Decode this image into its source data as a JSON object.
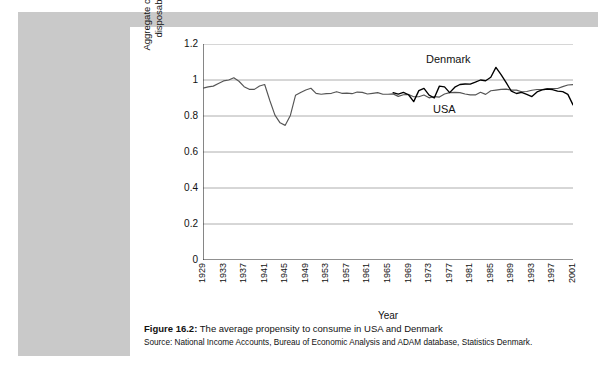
{
  "figure": {
    "label": "Figure 16.2:",
    "title": "The average propensity to consume in USA and Denmark",
    "source": "Source: National Income Accounts, Bureau of Economic Analysis and ADAM database, Statistics Denmark."
  },
  "chart_data": {
    "type": "line",
    "title": "",
    "xlabel": "Year",
    "ylabel": "Aggregate consumption / aggregate disposable household income",
    "ylim": [
      0,
      1.2
    ],
    "yticks": [
      "0",
      "0.2",
      "0.4",
      "0.6",
      "0.8",
      "1",
      "1.2"
    ],
    "ytick_values": [
      0,
      0.2,
      0.4,
      0.6,
      0.8,
      1,
      1.2
    ],
    "xlim": [
      1929,
      2001
    ],
    "xtick_labels": [
      "1929",
      "1933",
      "1937",
      "1941",
      "1945",
      "1949",
      "1953",
      "1957",
      "1961",
      "1965",
      "1969",
      "1973",
      "1977",
      "1981",
      "1985",
      "1989",
      "1993",
      "1997",
      "2001"
    ],
    "grid": "horizontal",
    "legend": "inline-annotation",
    "series": [
      {
        "name": "USA",
        "color": "#555555",
        "label_position": "inside-lower-right",
        "x": [
          1929,
          1930,
          1931,
          1932,
          1933,
          1934,
          1935,
          1936,
          1937,
          1938,
          1939,
          1940,
          1941,
          1942,
          1943,
          1944,
          1945,
          1946,
          1947,
          1948,
          1949,
          1950,
          1951,
          1952,
          1953,
          1954,
          1955,
          1956,
          1957,
          1958,
          1959,
          1960,
          1961,
          1962,
          1963,
          1964,
          1965,
          1966,
          1967,
          1968,
          1969,
          1970,
          1971,
          1972,
          1973,
          1974,
          1975,
          1976,
          1977,
          1978,
          1979,
          1980,
          1981,
          1982,
          1983,
          1984,
          1985,
          1986,
          1987,
          1988,
          1989,
          1990,
          1991,
          1992,
          1993,
          1994,
          1995,
          1996,
          1997,
          1998,
          1999,
          2000,
          2001
        ],
        "y": [
          0.955,
          0.962,
          0.966,
          0.981,
          0.995,
          1.0,
          1.012,
          0.993,
          0.963,
          0.948,
          0.948,
          0.967,
          0.975,
          0.886,
          0.805,
          0.762,
          0.748,
          0.803,
          0.915,
          0.93,
          0.944,
          0.954,
          0.926,
          0.921,
          0.924,
          0.926,
          0.935,
          0.926,
          0.927,
          0.924,
          0.933,
          0.931,
          0.922,
          0.926,
          0.93,
          0.921,
          0.921,
          0.923,
          0.909,
          0.918,
          0.92,
          0.907,
          0.907,
          0.917,
          0.901,
          0.908,
          0.905,
          0.922,
          0.93,
          0.931,
          0.93,
          0.922,
          0.917,
          0.917,
          0.932,
          0.92,
          0.94,
          0.944,
          0.948,
          0.949,
          0.944,
          0.944,
          0.935,
          0.936,
          0.943,
          0.947,
          0.947,
          0.951,
          0.953,
          0.953,
          0.963,
          0.972,
          0.974
        ]
      },
      {
        "name": "Denmark",
        "color": "#000000",
        "label_position": "above-curve",
        "x": [
          1966,
          1967,
          1968,
          1969,
          1970,
          1971,
          1972,
          1973,
          1974,
          1975,
          1976,
          1977,
          1978,
          1979,
          1980,
          1981,
          1982,
          1983,
          1984,
          1985,
          1986,
          1987,
          1988,
          1989,
          1990,
          1991,
          1992,
          1993,
          1994,
          1995,
          1996,
          1997,
          1998,
          1999,
          2000,
          2001
        ],
        "y": [
          0.93,
          0.922,
          0.931,
          0.918,
          0.88,
          0.941,
          0.953,
          0.916,
          0.9,
          0.966,
          0.962,
          0.93,
          0.96,
          0.975,
          0.978,
          0.977,
          0.988,
          1.0,
          0.996,
          1.015,
          1.07,
          1.03,
          0.985,
          0.938,
          0.925,
          0.931,
          0.92,
          0.908,
          0.934,
          0.945,
          0.95,
          0.947,
          0.938,
          0.935,
          0.92,
          0.862
        ]
      }
    ]
  }
}
